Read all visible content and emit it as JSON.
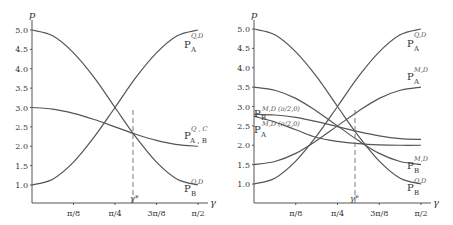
{
  "chart_data": [
    {
      "type": "line",
      "panel": "left",
      "ylabel": "p",
      "xlabel": "γ",
      "xlim": [
        0,
        1.5708
      ],
      "ylim": [
        0.6,
        5.2
      ],
      "y_ticks": [
        "1.0",
        "1.5",
        "2.0",
        "2.5",
        "3.0",
        "3.5",
        "4.0",
        "4.5",
        "5.0"
      ],
      "x_ticks": [
        "π/8",
        "π/4",
        "3π/8",
        "π/2"
      ],
      "grid": false,
      "annotation": {
        "label": "γ*",
        "x": 0.957,
        "style": "dashed vertical line"
      },
      "x": [
        0,
        0.1963,
        0.3927,
        0.589,
        0.7854,
        0.9817,
        1.1781,
        1.3744,
        1.5708
      ],
      "series": [
        {
          "name": "P_A^{Q,D}",
          "values": [
            1.0,
            1.15,
            1.59,
            2.24,
            3.0,
            3.77,
            4.41,
            4.85,
            5.0
          ]
        },
        {
          "name": "P_B^{Q,D}",
          "values": [
            5.0,
            4.85,
            4.41,
            3.77,
            3.0,
            2.24,
            1.59,
            1.15,
            1.0
          ]
        },
        {
          "name": "P_{A,B}^{Q,C}",
          "values": [
            3.0,
            2.96,
            2.85,
            2.69,
            2.5,
            2.31,
            2.15,
            2.04,
            2.0
          ]
        }
      ]
    },
    {
      "type": "line",
      "panel": "right",
      "ylabel": "p",
      "xlabel": "γ",
      "xlim": [
        0,
        1.5708
      ],
      "ylim": [
        0.6,
        5.2
      ],
      "y_ticks": [
        "1.0",
        "1.5",
        "2.0",
        "2.5",
        "3.0",
        "3.5",
        "4.0",
        "4.5",
        "5.0"
      ],
      "x_ticks": [
        "π/8",
        "π/4",
        "3π/8",
        "π/2"
      ],
      "grid": false,
      "annotation": {
        "label": "γ*",
        "x": 0.957,
        "style": "dashed vertical line"
      },
      "x": [
        0,
        0.1963,
        0.3927,
        0.589,
        0.7854,
        0.9817,
        1.1781,
        1.3744,
        1.5708
      ],
      "series": [
        {
          "name": "P_A^{Q,D}",
          "values": [
            1.0,
            1.15,
            1.59,
            2.24,
            3.0,
            3.77,
            4.41,
            4.85,
            5.0
          ]
        },
        {
          "name": "P_B^{Q,D}",
          "values": [
            5.0,
            4.85,
            4.41,
            3.77,
            3.0,
            2.24,
            1.59,
            1.15,
            1.0
          ]
        },
        {
          "name": "P_A^{M,D}",
          "values": [
            1.5,
            1.58,
            1.79,
            2.12,
            2.5,
            2.88,
            3.21,
            3.42,
            3.5
          ]
        },
        {
          "name": "P_B^{M,D}",
          "values": [
            3.5,
            3.42,
            3.21,
            2.88,
            2.5,
            2.12,
            1.79,
            1.58,
            1.5
          ]
        },
        {
          "name": "P_B^{M,D(π/2,0)}",
          "values": [
            2.8,
            2.78,
            2.72,
            2.61,
            2.48,
            2.35,
            2.24,
            2.17,
            2.15
          ]
        },
        {
          "name": "P_A^{M,D(π/2,0)}",
          "values": [
            2.75,
            2.6,
            2.4,
            2.2,
            2.1,
            2.04,
            2.01,
            2.0,
            2.0
          ]
        }
      ]
    }
  ],
  "labels": {
    "left": {
      "y_axis": "p",
      "x_axis": "γ",
      "gamma_star": "γ*",
      "pa_qd": {
        "base": "P",
        "sub": "A",
        "sup": "Q,D"
      },
      "pab_qc": {
        "base": "P",
        "sub": "A , B",
        "sup": "Q , C"
      },
      "pb_qd": {
        "base": "P",
        "sub": "B",
        "sup": "Q,D"
      }
    },
    "right": {
      "y_axis": "p",
      "x_axis": "γ",
      "gamma_star": "γ*",
      "pa_qd": {
        "base": "P",
        "sub": "A",
        "sup": "Q,D"
      },
      "pa_md": {
        "base": "P",
        "sub": "A",
        "sup": "M,D"
      },
      "pb_md": {
        "base": "P",
        "sub": "B",
        "sup": "M,D"
      },
      "pb_qd": {
        "base": "P",
        "sub": "B",
        "sup": "Q,D"
      },
      "pb_md_half": {
        "base": "P",
        "sub": "B",
        "sup": "M,D (π/2,0)"
      },
      "pa_md_half": {
        "base": "P",
        "sub": "A",
        "sup": "M,D (π/2,0)"
      }
    }
  }
}
